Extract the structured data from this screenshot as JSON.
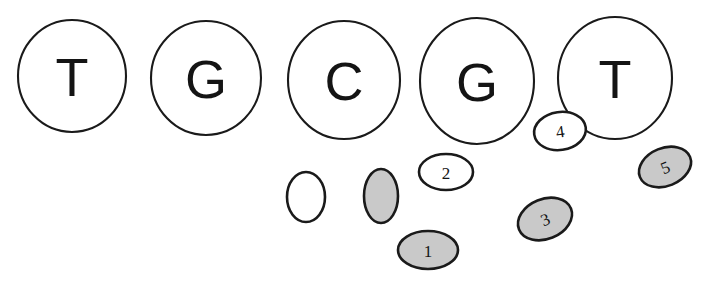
{
  "figure": {
    "background_color": "#ffffff",
    "outline_color": "#1a1a1a",
    "fill_white": "#ffffff",
    "fill_gray": "#c9c9c9"
  },
  "bases": {
    "sequence": "TGCGT",
    "items": [
      {
        "label": "T",
        "cx": 72,
        "cy": 76,
        "rx": 54,
        "ry": 56
      },
      {
        "label": "G",
        "cx": 206,
        "cy": 78,
        "rx": 55,
        "ry": 57
      },
      {
        "label": "C",
        "cx": 344,
        "cy": 80,
        "rx": 56,
        "ry": 59
      },
      {
        "label": "G",
        "cx": 477,
        "cy": 81,
        "rx": 57,
        "ry": 63
      },
      {
        "label": "T",
        "cx": 615,
        "cy": 78,
        "rx": 57,
        "ry": 61
      }
    ]
  },
  "features": {
    "items": [
      {
        "label": "",
        "cx": 306,
        "cy": 197,
        "rx": 19,
        "ry": 25,
        "rotate": 0,
        "fill": "white",
        "name": "unlabeled-white-ellipse"
      },
      {
        "label": "",
        "cx": 381,
        "cy": 196,
        "rx": 17,
        "ry": 27,
        "rotate": 0,
        "fill": "gray",
        "name": "unlabeled-gray-ellipse"
      },
      {
        "label": "1",
        "cx": 428,
        "cy": 250,
        "rx": 30,
        "ry": 19,
        "rotate": 0,
        "fill": "gray",
        "name": "feature-ellipse-1"
      },
      {
        "label": "2",
        "cx": 446,
        "cy": 172,
        "rx": 27,
        "ry": 18,
        "rotate": 0,
        "fill": "white",
        "name": "feature-ellipse-2"
      },
      {
        "label": "3",
        "cx": 545,
        "cy": 219,
        "rx": 28,
        "ry": 20,
        "rotate": -22,
        "fill": "gray",
        "name": "feature-ellipse-3"
      },
      {
        "label": "4",
        "cx": 560,
        "cy": 131,
        "rx": 26,
        "ry": 19,
        "rotate": -8,
        "fill": "white",
        "name": "feature-ellipse-4"
      },
      {
        "label": "5",
        "cx": 665,
        "cy": 167,
        "rx": 27,
        "ry": 19,
        "rotate": -22,
        "fill": "gray",
        "name": "feature-ellipse-5"
      }
    ]
  }
}
